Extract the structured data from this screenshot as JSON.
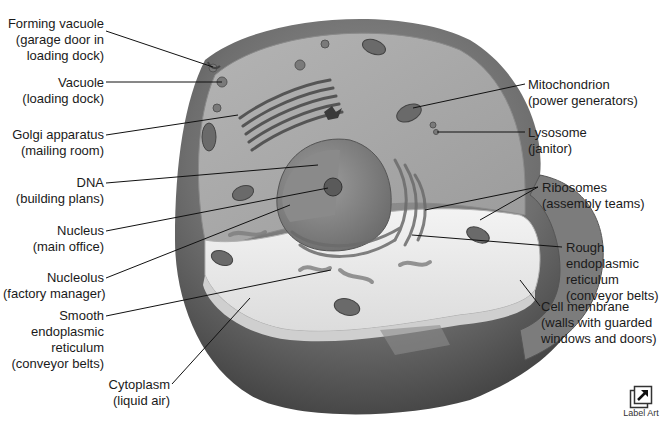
{
  "diagram": {
    "labels_left": [
      {
        "id": "forming-vacuole",
        "lines": [
          "Forming vacuole",
          "(garage door in",
          "loading dock)"
        ]
      },
      {
        "id": "vacuole",
        "lines": [
          "Vacuole",
          "(loading dock)"
        ]
      },
      {
        "id": "golgi",
        "lines": [
          "Golgi apparatus",
          "(mailing room)"
        ]
      },
      {
        "id": "dna",
        "lines": [
          "DNA",
          "(building plans)"
        ]
      },
      {
        "id": "nucleus",
        "lines": [
          "Nucleus",
          "(main office)"
        ]
      },
      {
        "id": "nucleolus",
        "lines": [
          "Nucleolus",
          "(factory manager)"
        ]
      },
      {
        "id": "smooth-er",
        "lines": [
          "Smooth",
          "endoplasmic",
          "reticulum",
          "(conveyor belts)"
        ]
      },
      {
        "id": "cytoplasm",
        "lines": [
          "Cytoplasm",
          "(liquid air)"
        ]
      }
    ],
    "labels_right": [
      {
        "id": "mitochondrion",
        "lines": [
          "Mitochondrion",
          "(power generators)"
        ]
      },
      {
        "id": "lysosome",
        "lines": [
          "Lysosome",
          "(janitor)"
        ]
      },
      {
        "id": "ribosomes",
        "lines": [
          "Ribosomes",
          "(assembly teams)"
        ]
      },
      {
        "id": "rough-er",
        "lines": [
          "Rough",
          "endoplasmic",
          "reticulum",
          "(conveyor belts)"
        ]
      },
      {
        "id": "cell-membrane",
        "lines": [
          "Cell membrane",
          "(walls with guarded",
          "windows and doors)"
        ]
      }
    ]
  },
  "label_art_button": {
    "label": "Label Art",
    "icon": "external-arrow-icon"
  },
  "colors": {
    "background": "#ffffff",
    "outer_shell": "#6e6e6e",
    "shell_dark": "#4f4f4f",
    "cytoplasm_upper": "#a9a9a9",
    "cytoplasm_floor": "#ececec",
    "organelle": "#7a7a7a",
    "leader_line": "#111111",
    "text": "#1a1a1a"
  }
}
